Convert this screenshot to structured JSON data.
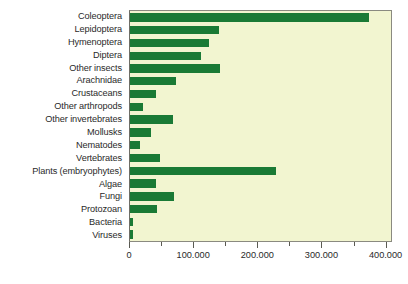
{
  "chart_data": {
    "type": "bar",
    "orientation": "horizontal",
    "title": "",
    "subtitle": "",
    "xlabel": "",
    "ylabel": "",
    "xlim": [
      0,
      410000
    ],
    "grid": false,
    "legend": null,
    "bar_color": "#1a7a35",
    "plot_background": "#f2f5d0",
    "page_background": "#ffffff",
    "axis_color": "#5a5a52",
    "categories": [
      "Coleoptera",
      "Lepidoptera",
      "Hymenoptera",
      "Diptera",
      "Other insects",
      "Arachnidae",
      "Crustaceans",
      "Other arthropods",
      "Other invertebrates",
      "Mollusks",
      "Nematodes",
      "Vertebrates",
      "Plants (embryophytes)",
      "Algae",
      "Fungi",
      "Protozoan",
      "Bacteria",
      "Viruses"
    ],
    "values": [
      373000,
      139000,
      123000,
      111000,
      141000,
      72000,
      41000,
      20000,
      67000,
      33000,
      16000,
      47000,
      227000,
      41000,
      69000,
      42000,
      5000,
      5000
    ],
    "xticks": [
      0,
      100000,
      200000,
      300000,
      400000
    ],
    "xtick_labels": [
      "0",
      "100.000",
      "200.000",
      "300.000",
      "400.000"
    ],
    "xtick_minor": [
      50000,
      150000,
      250000,
      350000
    ]
  }
}
